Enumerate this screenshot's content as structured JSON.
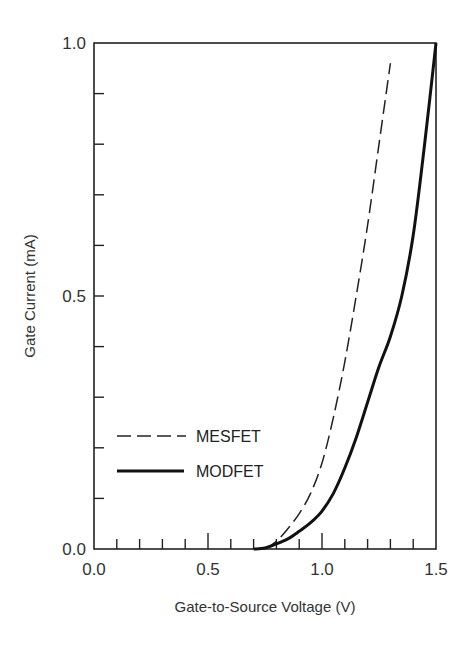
{
  "chart_data": {
    "type": "line",
    "title": "",
    "xlabel": "Gate-to-Source Voltage (V)",
    "ylabel": "Gate Current (mA)",
    "xlim": [
      0.0,
      1.5
    ],
    "ylim": [
      0.0,
      1.0
    ],
    "x_ticks": [
      "0.0",
      "0.5",
      "1.0",
      "1.5"
    ],
    "y_ticks": [
      "0.0",
      "0.5",
      "1.0"
    ],
    "x_minor_step": 0.1,
    "y_minor_step": 0.1,
    "grid": false,
    "legend_position": "lower-left inside",
    "series": [
      {
        "name": "MESFET",
        "style": "dashed",
        "x": [
          0.75,
          0.8,
          0.85,
          0.9,
          0.95,
          1.0,
          1.05,
          1.1,
          1.15,
          1.2,
          1.25,
          1.3
        ],
        "y": [
          0.0,
          0.015,
          0.04,
          0.07,
          0.11,
          0.17,
          0.26,
          0.37,
          0.5,
          0.64,
          0.8,
          0.96
        ]
      },
      {
        "name": "MODFET",
        "style": "solid-thick",
        "x": [
          0.7,
          0.75,
          0.8,
          0.85,
          0.9,
          0.95,
          1.0,
          1.05,
          1.1,
          1.15,
          1.2,
          1.25,
          1.3,
          1.35,
          1.4,
          1.45,
          1.5
        ],
        "y": [
          0.0,
          0.002,
          0.01,
          0.02,
          0.035,
          0.052,
          0.075,
          0.11,
          0.16,
          0.22,
          0.29,
          0.36,
          0.42,
          0.5,
          0.62,
          0.8,
          1.0
        ]
      }
    ]
  },
  "legend": {
    "items": [
      {
        "label": "MESFET"
      },
      {
        "label": "MODFET"
      }
    ]
  }
}
